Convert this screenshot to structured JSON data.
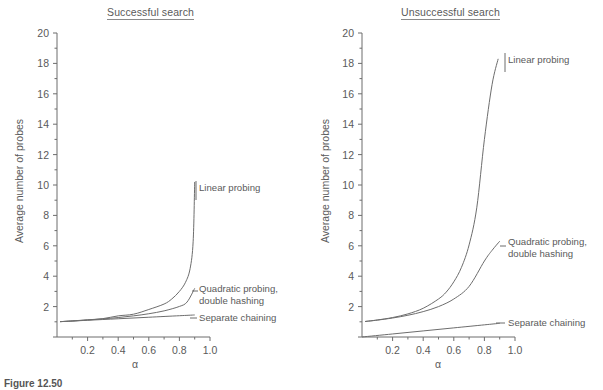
{
  "figure": {
    "caption": "Figure 12.50",
    "panels": [
      {
        "key": "successful",
        "title": "Successful search",
        "xlabel": "α",
        "ylabel": "Average number of probes",
        "labels": {
          "linear": "Linear probing",
          "quadratic_line1": "Quadratic probing,",
          "quadratic_line2": "double hashing",
          "chaining": "Separate chaining"
        }
      },
      {
        "key": "unsuccessful",
        "title": "Unsuccessful search",
        "xlabel": "α",
        "ylabel": "Average number of probes",
        "labels": {
          "linear": "Linear probing",
          "quadratic_line1": "Quadratic probing,",
          "quadratic_line2": "double hashing",
          "chaining": "Separate chaining"
        }
      }
    ]
  },
  "chart_data": [
    {
      "type": "line",
      "title": "Successful search",
      "xlabel": "α",
      "ylabel": "Average number of probes",
      "xlim": [
        0,
        1.0
      ],
      "ylim": [
        0,
        20
      ],
      "xticks": [
        0.2,
        0.4,
        0.6,
        0.8,
        1.0
      ],
      "xticklabels": [
        "0.2",
        "0.4",
        "0.6",
        "0.8",
        "1.0"
      ],
      "yticks": [
        0,
        2,
        4,
        6,
        8,
        10,
        12,
        14,
        16,
        18,
        20
      ],
      "yticklabels": [
        "",
        "2",
        "4",
        "6",
        "8",
        "10",
        "12",
        "14",
        "16",
        "18",
        "20"
      ],
      "minor_xtick_step": 0.1,
      "minor_ytick_step": 1,
      "grid": false,
      "legend": "inline-annotations",
      "series": [
        {
          "name": "Linear probing",
          "x": [
            0.02,
            0.1,
            0.2,
            0.3,
            0.4,
            0.5,
            0.6,
            0.7,
            0.75,
            0.8,
            0.84,
            0.87,
            0.89,
            0.9
          ],
          "values": [
            1.01,
            1.06,
            1.13,
            1.21,
            1.39,
            1.5,
            1.81,
            2.17,
            2.5,
            3.0,
            3.6,
            4.5,
            6.3,
            10.2
          ]
        },
        {
          "name": "Quadratic probing, double hashing",
          "x": [
            0.02,
            0.1,
            0.2,
            0.3,
            0.4,
            0.5,
            0.6,
            0.7,
            0.8,
            0.85,
            0.9
          ],
          "values": [
            1.01,
            1.05,
            1.12,
            1.19,
            1.28,
            1.39,
            1.53,
            1.72,
            2.01,
            2.3,
            3.2
          ]
        },
        {
          "name": "Separate chaining",
          "x": [
            0.02,
            0.2,
            0.4,
            0.6,
            0.8,
            0.9
          ],
          "values": [
            1.01,
            1.1,
            1.2,
            1.3,
            1.4,
            1.45
          ]
        }
      ]
    },
    {
      "type": "line",
      "title": "Unsuccessful search",
      "xlabel": "α",
      "ylabel": "Average number of probes",
      "xlim": [
        0,
        1.0
      ],
      "ylim": [
        0,
        20
      ],
      "xticks": [
        0.2,
        0.4,
        0.6,
        0.8,
        1.0
      ],
      "xticklabels": [
        "0.2",
        "0.4",
        "0.6",
        "0.8",
        "1.0"
      ],
      "yticks": [
        0,
        2,
        4,
        6,
        8,
        10,
        12,
        14,
        16,
        18,
        20
      ],
      "yticklabels": [
        "",
        "2",
        "4",
        "6",
        "8",
        "10",
        "12",
        "14",
        "16",
        "18",
        "20"
      ],
      "minor_xtick_step": 0.1,
      "minor_ytick_step": 1,
      "grid": false,
      "legend": "inline-annotations",
      "series": [
        {
          "name": "Linear probing",
          "x": [
            0.02,
            0.1,
            0.2,
            0.3,
            0.4,
            0.5,
            0.55,
            0.6,
            0.65,
            0.7,
            0.75,
            0.8,
            0.85,
            0.89
          ],
          "values": [
            1.02,
            1.12,
            1.28,
            1.52,
            1.89,
            2.5,
            2.95,
            3.63,
            4.58,
            6.06,
            8.5,
            13.0,
            16.6,
            18.3
          ]
        },
        {
          "name": "Quadratic probing, double hashing",
          "x": [
            0.02,
            0.1,
            0.2,
            0.3,
            0.4,
            0.5,
            0.6,
            0.7,
            0.8,
            0.85,
            0.9
          ],
          "values": [
            1.02,
            1.11,
            1.25,
            1.43,
            1.67,
            2.0,
            2.5,
            3.33,
            5.0,
            5.7,
            6.3
          ]
        },
        {
          "name": "Separate chaining",
          "x": [
            0.0,
            0.2,
            0.4,
            0.6,
            0.8,
            0.9
          ],
          "values": [
            0.0,
            0.2,
            0.4,
            0.6,
            0.8,
            0.9
          ]
        }
      ]
    }
  ]
}
